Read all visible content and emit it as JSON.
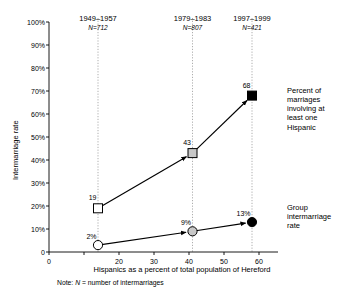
{
  "chart_data": {
    "type": "line",
    "title": "",
    "xlabel": "Hispanics as a percent of total population of Hereford",
    "ylabel": "Intermarriage rate",
    "xlim": [
      0,
      62
    ],
    "ylim": [
      0,
      100
    ],
    "grid": false,
    "legend_position": "right-inline",
    "xticks": [
      0,
      10,
      20,
      30,
      40,
      50,
      60
    ],
    "xticklabels": [
      "0",
      "",
      "20",
      "30",
      "40",
      "50",
      "60"
    ],
    "yticks": [
      0,
      10,
      20,
      30,
      40,
      50,
      60,
      70,
      80,
      90,
      100
    ],
    "yticklabels": [
      "0",
      "10%",
      "20%",
      "30%",
      "40%",
      "50%",
      "60%",
      "70%",
      "80%",
      "90%",
      "100%"
    ],
    "x": [
      14,
      41,
      58
    ],
    "periods": [
      {
        "label": "1949–1957",
        "n_label": "N=712",
        "x": 14
      },
      {
        "label": "1979–1983",
        "n_label": "N=807",
        "x": 41
      },
      {
        "label": "1997–1999",
        "n_label": "N=421",
        "x": 58
      }
    ],
    "series": [
      {
        "name": "Percent of marriages involving at least one Hispanic",
        "marker": "square",
        "values": [
          19,
          43,
          68
        ],
        "point_labels": [
          "19",
          "43",
          "68"
        ],
        "marker_fills": [
          "#ffffff",
          "#c8c8c8",
          "#000000"
        ]
      },
      {
        "name": "Group intermarriage rate",
        "marker": "circle",
        "values": [
          3,
          9,
          13
        ],
        "point_labels": [
          "2%",
          "9%",
          "13%"
        ],
        "marker_fills": [
          "#ffffff",
          "#c8c8c8",
          "#000000"
        ]
      }
    ],
    "annotations": [
      {
        "text": "Note:  N = number of intermarriages"
      }
    ],
    "colors": {
      "line": "#000000",
      "marker_mid": "#c8c8c8",
      "guide": "#999999",
      "axis": "#000000"
    }
  },
  "note": {
    "prefix": "Note:",
    "italic": "N",
    "rest": "= number of intermarriages"
  },
  "legend": {
    "series1": "Percent of\nmarriages\ninvolving at\nleast one\nHispanic",
    "series2": "Group\nintermarriage\nrate"
  }
}
